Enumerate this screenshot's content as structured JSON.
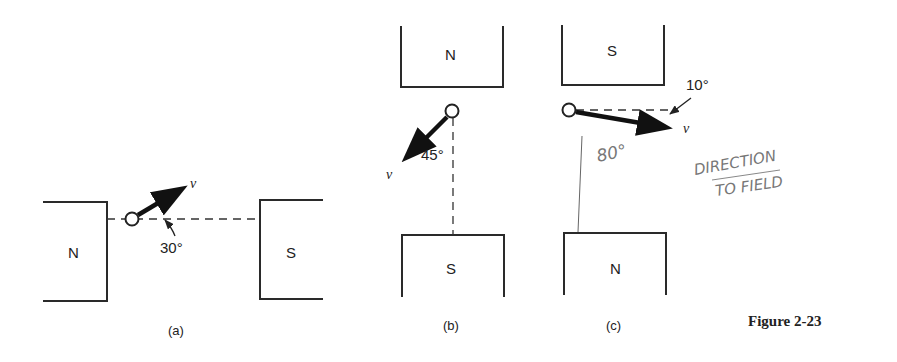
{
  "figure": {
    "title": "Figure 2-23",
    "panels": [
      {
        "caption": "(a)",
        "left_pole": "N",
        "right_pole": "S",
        "velocity_label": "v",
        "angle_label": "30°"
      },
      {
        "caption": "(b)",
        "top_pole": "N",
        "bottom_pole": "S",
        "velocity_label": "v",
        "angle_label": "45°"
      },
      {
        "caption": "(c)",
        "top_pole": "S",
        "bottom_pole": "N",
        "velocity_label": "v",
        "angle_label": "10°",
        "handwritten_angle": "80°"
      }
    ],
    "handwritten_note": {
      "line1": "DIRECTION",
      "line2": "TO FIELD"
    }
  },
  "colors": {
    "ink": "#222222",
    "pencil": "#777777",
    "background": "#ffffff"
  }
}
